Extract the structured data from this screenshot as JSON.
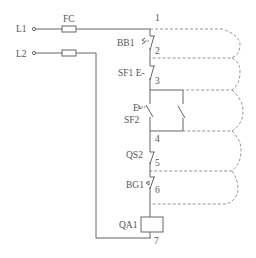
{
  "diagram": {
    "type": "electrical control circuit schematic",
    "terminals": [
      {
        "id": "L1",
        "label": "L1"
      },
      {
        "id": "L2",
        "label": "L2"
      }
    ],
    "components": [
      {
        "id": "FC",
        "label": "FC",
        "kind": "fuse",
        "line": "L1"
      },
      {
        "id": "FU2",
        "label": "",
        "kind": "fuse",
        "line": "L2"
      },
      {
        "id": "BB1",
        "label": "BB1",
        "kind": "thermal-overload-nc-contact",
        "from": "1",
        "to": "2"
      },
      {
        "id": "SF1",
        "label": "SF1 E-",
        "kind": "stop-pushbutton-nc",
        "from": "2",
        "to": "3"
      },
      {
        "id": "SF2",
        "label": "SF2",
        "prefix": "E-",
        "kind": "start-pushbutton-no",
        "from": "3",
        "to": "4"
      },
      {
        "id": "QA1_aux",
        "label": "",
        "kind": "self-holding-no-contact",
        "from": "3",
        "to": "4"
      },
      {
        "id": "QS2",
        "label": "QS2",
        "kind": "nc-contact",
        "from": "4",
        "to": "5"
      },
      {
        "id": "BG1",
        "label": "BG1",
        "kind": "limit-switch-nc",
        "from": "5",
        "to": "6"
      },
      {
        "id": "QA1",
        "label": "QA1",
        "kind": "contactor-coil",
        "from": "6",
        "to": "7"
      }
    ],
    "nodes": [
      "1",
      "2",
      "3",
      "4",
      "5",
      "6",
      "7"
    ],
    "dashed_loops": [
      {
        "from": "1",
        "to": "2"
      },
      {
        "from": "2",
        "to": "3"
      },
      {
        "from": "3",
        "to": "4"
      },
      {
        "from": "4",
        "to": "5"
      },
      {
        "from": "5",
        "to": "6"
      }
    ],
    "colors": {
      "line": "#666666",
      "text": "#555555",
      "background": "#ffffff"
    }
  }
}
